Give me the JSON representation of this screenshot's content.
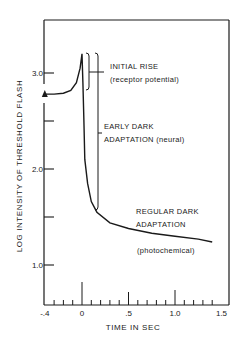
{
  "chart_data": {
    "type": "line",
    "title": "",
    "xlabel": "TIME IN SEC",
    "ylabel": "LOG INTENSITY OF THRESHOLD FLASH",
    "xlim": [
      -0.4,
      1.5
    ],
    "ylim": [
      0.6,
      3.6
    ],
    "grid": false,
    "x_ticks": [
      {
        "value": -0.4,
        "label": "-.4"
      },
      {
        "value": 0,
        "label": "0"
      },
      {
        "value": 0.5,
        "label": ".5"
      },
      {
        "value": 1.0,
        "label": "1.0"
      },
      {
        "value": 1.5,
        "label": "1.5"
      }
    ],
    "x_minor_step": 0.1,
    "y_ticks": [
      {
        "value": 1.0,
        "label": "1.0"
      },
      {
        "value": 1.5,
        "label": ""
      },
      {
        "value": 2.0,
        "label": "2.0"
      },
      {
        "value": 2.5,
        "label": ""
      },
      {
        "value": 3.0,
        "label": "3.0"
      }
    ],
    "start_marker": {
      "x": -0.4,
      "y": 2.78,
      "shape": "triangle"
    },
    "series": [
      {
        "name": "threshold",
        "x": [
          -0.4,
          -0.3,
          -0.2,
          -0.12,
          -0.06,
          -0.02,
          0.0,
          0.01,
          0.02,
          0.03,
          0.06,
          0.1,
          0.16,
          0.3,
          0.5,
          0.75,
          1.0,
          1.25,
          1.4
        ],
        "y": [
          2.78,
          2.78,
          2.79,
          2.82,
          2.9,
          3.05,
          3.2,
          2.9,
          2.5,
          2.1,
          1.85,
          1.66,
          1.55,
          1.44,
          1.38,
          1.33,
          1.3,
          1.27,
          1.24
        ]
      }
    ],
    "annotations": [
      {
        "id": "initial_rise",
        "lines": [
          "INITIAL RISE",
          "(receptor potential)"
        ],
        "bracket_y": [
          3.2,
          2.8
        ]
      },
      {
        "id": "early_dark",
        "lines": [
          "EARLY DARK",
          "ADAPTATION (neural)"
        ],
        "bracket_y": [
          3.2,
          1.57
        ]
      },
      {
        "id": "regular_dark",
        "lines": [
          "REGULAR DARK",
          "ADAPTATION",
          "(photochemical)"
        ]
      }
    ]
  }
}
